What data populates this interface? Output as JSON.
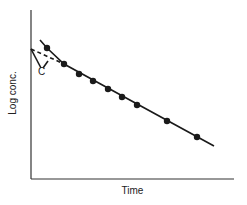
{
  "chart_data": {
    "type": "scatter",
    "title": "",
    "xlabel": "Time",
    "ylabel": "Log conc.",
    "x_ticks": [],
    "y_ticks": [],
    "grid": false,
    "legend": null,
    "annotations": [
      {
        "text": "C",
        "description": "Back-extrapolated intercept of terminal log-linear phase on y-axis (dashed line)"
      }
    ],
    "series": [
      {
        "name": "observed",
        "style": "markers",
        "pixel_points": [
          [
            47,
            48
          ],
          [
            64,
            64
          ],
          [
            79,
            74
          ],
          [
            93,
            81
          ],
          [
            108,
            89
          ],
          [
            122,
            97
          ],
          [
            137,
            105
          ],
          [
            167,
            121
          ],
          [
            197,
            137
          ]
        ]
      },
      {
        "name": "fitted curve",
        "style": "solid line",
        "pixel_points": [
          [
            40,
            40
          ],
          [
            47,
            48
          ],
          [
            64,
            64
          ],
          [
            214,
            146
          ]
        ]
      },
      {
        "name": "back-extrapolation",
        "style": "dashed line",
        "pixel_points": [
          [
            31,
            49
          ],
          [
            64,
            64
          ]
        ]
      }
    ],
    "axes_pixels": {
      "x0": 31,
      "y0": 179,
      "x1": 234,
      "ytop": 10
    }
  },
  "labels": {
    "x": "Time",
    "y": "Log conc.",
    "c": "C"
  },
  "colors": {
    "ink": "#1a1a1a",
    "background": "#ffffff"
  }
}
